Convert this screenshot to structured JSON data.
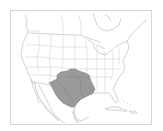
{
  "map": {
    "title": "Species range map - North America",
    "region": "North America (USA, southern Canada, Mexico, Caribbean)",
    "range_description": "Shaded range covering Texas, Oklahoma, Arkansas, Louisiana and northeastern Mexico",
    "colors": {
      "background": "#ffffff",
      "land": "#ffffff",
      "borders": "#b4b4b4",
      "range_fill": "#9a9a9a",
      "range_outline": "#6e6e6e",
      "water_shadow": "#d8d8d8",
      "frame": "#d6d6d6"
    },
    "legend": []
  }
}
